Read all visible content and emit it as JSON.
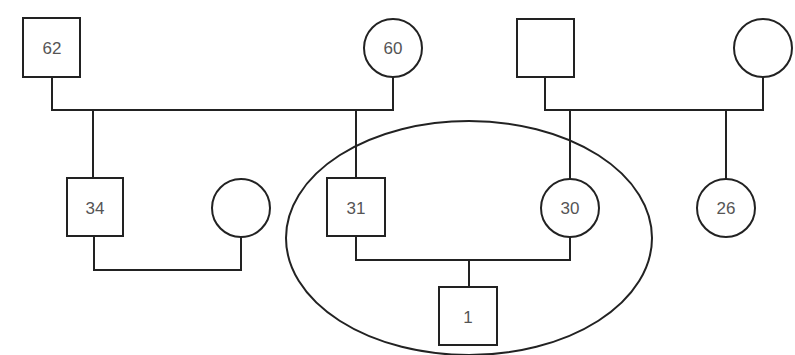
{
  "diagram": {
    "type": "family-pedigree",
    "highlight": "ellipse around nuclear family (31, 30, 1)",
    "generation1": {
      "left_couple": {
        "male": {
          "age": "62"
        },
        "female": {
          "age": "60"
        }
      },
      "right_couple": {
        "male": {
          "age": ""
        },
        "female": {
          "age": ""
        }
      }
    },
    "generation2": {
      "male_34": {
        "age": "34"
      },
      "spouse_of_34": {
        "age": ""
      },
      "male_31": {
        "age": "31"
      },
      "female_30": {
        "age": "30"
      },
      "female_26": {
        "age": "26"
      }
    },
    "generation3": {
      "male_1": {
        "age": "1"
      }
    },
    "colors": {
      "line": "#222222",
      "label": "#555555",
      "background": "#ffffff"
    }
  }
}
